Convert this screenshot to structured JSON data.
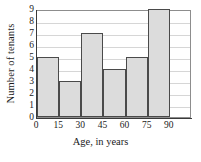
{
  "chart_data": {
    "type": "bar",
    "title": "",
    "xlabel": "Age, in years",
    "ylabel": "Number of tenants",
    "categories": [
      "0-15",
      "15-30",
      "30-45",
      "45-60",
      "60-75",
      "75-90"
    ],
    "bin_edges": [
      0,
      15,
      30,
      45,
      60,
      75,
      90
    ],
    "values": [
      5,
      3,
      7,
      4,
      5,
      9
    ],
    "xtick_labels": [
      "0",
      "15",
      "30",
      "45",
      "60",
      "75",
      "90"
    ],
    "ytick_labels": [
      "0",
      "1",
      "2",
      "3",
      "4",
      "5",
      "6",
      "7",
      "8",
      "9"
    ],
    "xlim": [
      0,
      105
    ],
    "ylim": [
      0,
      9
    ],
    "grid": true,
    "grid_axis": "y",
    "legend": false,
    "legend_position": "none",
    "bar_fill_color": "#dcdcdc",
    "bar_edge_color": "#4a4a4a",
    "gridline_color": "#d6d6d6",
    "axis_color": "#3a3a3a",
    "plot_background": "#ffffff"
  }
}
